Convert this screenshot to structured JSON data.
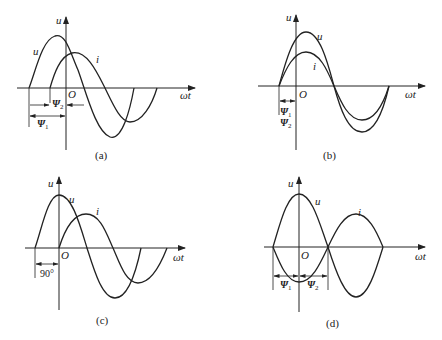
{
  "panels": [
    {
      "id": "a",
      "caption": "(a)",
      "y_axis_label": "u",
      "x_axis_label": "ωt",
      "origin_label": "O",
      "curve_labels": {
        "u": "u",
        "i": "i"
      },
      "annotations": [
        {
          "symbol": "Ψ",
          "sub": "2"
        },
        {
          "symbol": "Ψ",
          "sub": "1"
        }
      ],
      "description": "u leads i; both with positive initial phase, Ψ1 > Ψ2"
    },
    {
      "id": "b",
      "caption": "(b)",
      "y_axis_label": "u",
      "x_axis_label": "ωt",
      "origin_label": "O",
      "curve_labels": {
        "u": "u",
        "i": "i"
      },
      "annotations": [
        {
          "symbol": "Ψ",
          "sub": "1"
        },
        {
          "symbol": "Ψ",
          "sub": "2"
        }
      ],
      "description": "u and i in phase, Ψ1 = Ψ2"
    },
    {
      "id": "c",
      "caption": "(c)",
      "y_axis_label": "u",
      "x_axis_label": "ωt",
      "origin_label": "O",
      "curve_labels": {
        "u": "u",
        "i": "i"
      },
      "annotations": [
        {
          "text": "90°"
        }
      ],
      "description": "u leads i by 90°"
    },
    {
      "id": "d",
      "caption": "(d)",
      "y_axis_label": "u",
      "x_axis_label": "ωt",
      "origin_label": "O",
      "curve_labels": {
        "u": "u",
        "i": "i"
      },
      "annotations": [
        {
          "symbol": "Ψ",
          "sub": "1"
        },
        {
          "symbol": "Ψ",
          "sub": "2"
        }
      ],
      "description": "u and i in antiphase (180°)"
    }
  ]
}
